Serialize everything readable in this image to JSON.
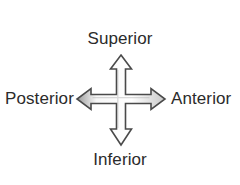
{
  "figure": {
    "name": "anatomical-direction-diagram",
    "background_color": "#ffffff",
    "width": 240,
    "height": 185
  },
  "labels": {
    "superior": "Superior",
    "inferior": "Inferior",
    "posterior": "Posterior",
    "anterior": "Anterior"
  },
  "arrow": {
    "icon": "four-way-double-arrow-icon",
    "outline_color": "#4a4a4a",
    "fill_color": "#fcfcfc",
    "shade_color": "#8f8f8f",
    "center_x": 121,
    "center_y": 99,
    "top_tip_y": 55,
    "bottom_tip_y": 145,
    "left_tip_x": 77,
    "right_tip_x": 165,
    "shaft_width": 9,
    "head_width": 21,
    "head_length": 14,
    "directions": [
      "up",
      "down",
      "left",
      "right"
    ]
  },
  "text_color": "#2b2b2b"
}
